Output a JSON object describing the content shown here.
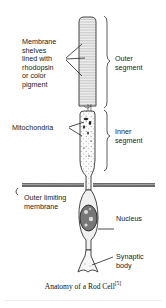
{
  "figure": {
    "title": "Anatomy of a Rod Cell",
    "citation": "[5]",
    "labels": {
      "membrane_shelves": "Membrane\nshelves\nlined with\nrhodopsin\nor color\npigment",
      "outer_segment": "Outer\nsegment",
      "mitochondria": "Mitochondria",
      "inner_segment": "Inner\nsegment",
      "outer_limiting_membrane": "Outer limiting\nmembrane",
      "nucleus": "Nucleus",
      "synaptic_body": "Synaptic\nbody"
    }
  }
}
